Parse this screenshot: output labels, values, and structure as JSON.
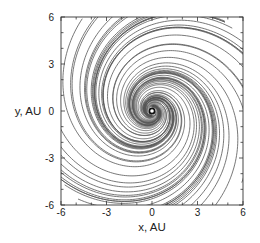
{
  "chart_data": {
    "type": "line",
    "title": "",
    "xlabel": "x, AU",
    "ylabel": "y, AU",
    "xlim": [
      -6,
      6
    ],
    "ylim": [
      -6,
      6
    ],
    "x_ticks": [
      -6,
      -3,
      0,
      3,
      6
    ],
    "y_ticks": [
      -6,
      -3,
      0,
      3,
      6
    ],
    "x_tick_labels": [
      "-6",
      "-3",
      "0",
      "3",
      "6"
    ],
    "y_tick_labels": [
      "-6",
      "-3",
      "0",
      "3",
      "6"
    ],
    "minor_tick_step": 1,
    "grid": false,
    "legend": null,
    "central_object": {
      "x": 0,
      "y": 0,
      "marker": "white dot with black ring"
    },
    "spiral": {
      "n_streamlines": 44,
      "pitch_b": 0.32,
      "r_start_AU": 0.25,
      "r_max_AU": 7.5,
      "arms": 2,
      "line_color": "#555555",
      "line_width": 0.8
    }
  },
  "colors": {
    "axis": "#333333",
    "line": "#555555",
    "background": "#ffffff"
  }
}
